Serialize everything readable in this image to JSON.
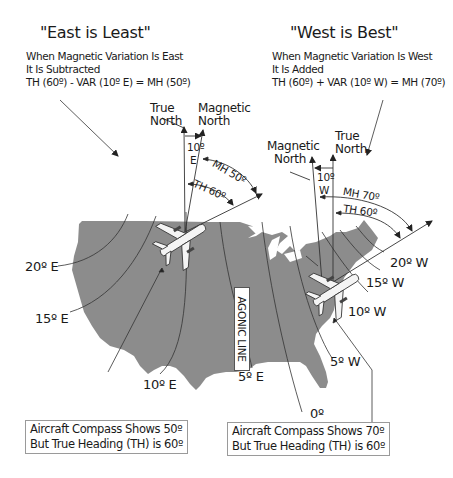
{
  "left_panel": {
    "title": "\"East is Least\"",
    "note_line1": "When Magnetic Variation Is East",
    "note_line2": "It Is Subtracted",
    "formula": "TH (60º) - VAR (10º E) = MH (50º)",
    "true_north_line1": "True",
    "true_north_line2": "North",
    "magnetic_north_line1": "Magnetic",
    "magnetic_north_line2": "North",
    "variation_line1": "10º",
    "variation_line2": "E",
    "mh_label": "MH 50º",
    "th_label": "TH 60º",
    "callout_line1": "Aircraft Compass Shows 50º",
    "callout_line2": "But True Heading (TH) is 60º"
  },
  "right_panel": {
    "title": "\"West is Best\"",
    "note_line1": "When Magnetic Variation Is West",
    "note_line2": "It Is Added",
    "formula": "TH (60º) + VAR (10º W) = MH (70º)",
    "true_north_line1": "True",
    "true_north_line2": "North",
    "magnetic_north_line1": "Magnetic",
    "magnetic_north_line2": "North",
    "variation_line1": "10º",
    "variation_line2": "W",
    "mh_label": "MH 70º",
    "th_label": "TH 60º",
    "callout_line1": "Aircraft Compass Shows 70º",
    "callout_line2": "But True Heading (TH) is 60º"
  },
  "isogonic_lines": {
    "e20": "20º E",
    "e15": "15º E",
    "e10": "10º E",
    "e5": "5º E",
    "zero": "0º",
    "w5": "5º W",
    "w10": "10º W",
    "w15": "15º W",
    "w20": "20º W",
    "agonic": "AGONIC LINE"
  },
  "colors": {
    "map_fill": "#8c8c8c",
    "line": "#333333",
    "background": "#ffffff"
  }
}
